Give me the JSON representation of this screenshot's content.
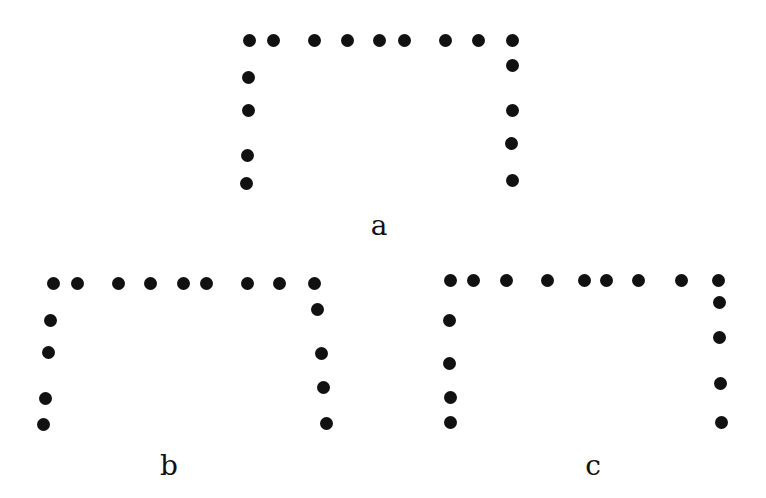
{
  "diagram": {
    "dot_color": "#111111",
    "figures": [
      {
        "label": "a",
        "label_pos": [
          379,
          226
        ],
        "dots": [
          [
            249,
            40
          ],
          [
            273,
            40
          ],
          [
            314,
            40
          ],
          [
            347,
            40
          ],
          [
            379,
            40
          ],
          [
            404,
            40
          ],
          [
            445,
            40
          ],
          [
            478,
            40
          ],
          [
            512,
            40
          ],
          [
            248,
            77
          ],
          [
            248,
            110
          ],
          [
            247,
            155
          ],
          [
            246,
            183
          ],
          [
            512,
            65
          ],
          [
            512,
            110
          ],
          [
            511,
            143
          ],
          [
            512,
            180
          ]
        ]
      },
      {
        "label": "b",
        "label_pos": [
          169,
          466
        ],
        "dots": [
          [
            53,
            283
          ],
          [
            77,
            283
          ],
          [
            118,
            283
          ],
          [
            150,
            283
          ],
          [
            183,
            283
          ],
          [
            206,
            283
          ],
          [
            247,
            283
          ],
          [
            279,
            283
          ],
          [
            314,
            283
          ],
          [
            50,
            320
          ],
          [
            48,
            352
          ],
          [
            45,
            398
          ],
          [
            43,
            424
          ],
          [
            317,
            309
          ],
          [
            321,
            353
          ],
          [
            323,
            387
          ],
          [
            326,
            423
          ]
        ]
      },
      {
        "label": "c",
        "label_pos": [
          593,
          466
        ],
        "dots": [
          [
            450,
            280
          ],
          [
            473,
            280
          ],
          [
            506,
            280
          ],
          [
            547,
            280
          ],
          [
            584,
            280
          ],
          [
            606,
            280
          ],
          [
            638,
            280
          ],
          [
            681,
            280
          ],
          [
            718,
            280
          ],
          [
            449,
            320
          ],
          [
            449,
            363
          ],
          [
            450,
            397
          ],
          [
            450,
            422
          ],
          [
            719,
            302
          ],
          [
            719,
            337
          ],
          [
            720,
            383
          ],
          [
            721,
            422
          ]
        ]
      }
    ]
  }
}
